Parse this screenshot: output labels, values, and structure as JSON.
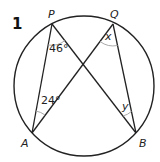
{
  "problem": {
    "number": "1"
  },
  "colors": {
    "line": "#222222",
    "arc": "#aaaaaa",
    "background": "#ffffff"
  },
  "circle": {
    "cx": 84,
    "cy": 86,
    "r": 70
  },
  "points": {
    "P": {
      "label": "P",
      "x": 52,
      "y": 24,
      "lx": 49,
      "ly": 18
    },
    "Q": {
      "label": "Q",
      "x": 113,
      "y": 24,
      "lx": 112,
      "ly": 18
    },
    "A": {
      "label": "A",
      "x": 32,
      "y": 133,
      "lx": 22,
      "ly": 147
    },
    "B": {
      "label": "B",
      "x": 136,
      "y": 133,
      "lx": 139,
      "ly": 147
    }
  },
  "angles": {
    "P": {
      "text": "46°"
    },
    "A": {
      "text": "24°"
    },
    "Q": {
      "text": "x"
    },
    "B": {
      "text": "y"
    }
  }
}
